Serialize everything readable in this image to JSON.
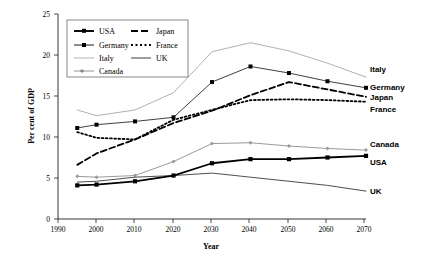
{
  "chart_data": {
    "type": "line",
    "title": "",
    "xlabel": "Year",
    "ylabel": "Per cent of GDP",
    "xlim": [
      1990,
      2070
    ],
    "ylim": [
      0,
      25
    ],
    "xticks": [
      1990,
      2000,
      2010,
      2020,
      2030,
      2040,
      2050,
      2060,
      2070
    ],
    "yticks": [
      0,
      5,
      10,
      15,
      20,
      25
    ],
    "grid": false,
    "legend_position": "top-left",
    "x": [
      1995,
      2000,
      2010,
      2020,
      2030,
      2040,
      2050,
      2060,
      2070
    ],
    "series": [
      {
        "name": "USA",
        "values": [
          4.1,
          4.2,
          4.6,
          5.3,
          6.8,
          7.3,
          7.3,
          7.5,
          7.7
        ]
      },
      {
        "name": "Japan",
        "values": [
          6.6,
          8.0,
          9.7,
          11.7,
          13.2,
          15.1,
          16.7,
          15.8,
          14.9
        ]
      },
      {
        "name": "Germany",
        "values": [
          11.1,
          11.5,
          11.9,
          12.4,
          16.7,
          18.6,
          17.8,
          16.8,
          16.0
        ]
      },
      {
        "name": "France",
        "values": [
          10.6,
          9.9,
          9.7,
          12.1,
          13.3,
          14.5,
          14.6,
          14.5,
          14.3
        ]
      },
      {
        "name": "Italy",
        "values": [
          13.3,
          12.6,
          13.3,
          15.4,
          20.4,
          21.5,
          20.5,
          19.0,
          17.3
        ]
      },
      {
        "name": "UK",
        "values": [
          4.5,
          4.6,
          5.1,
          5.3,
          5.6,
          5.1,
          4.6,
          4.1,
          3.4
        ]
      },
      {
        "name": "Canada",
        "values": [
          5.2,
          5.1,
          5.3,
          7.0,
          9.2,
          9.3,
          8.9,
          8.6,
          8.4
        ]
      }
    ]
  },
  "legend": {
    "items": [
      {
        "label": "USA"
      },
      {
        "label": "Japan"
      },
      {
        "label": "Germany"
      },
      {
        "label": "France"
      },
      {
        "label": "Italy"
      },
      {
        "label": "UK"
      },
      {
        "label": "Canada"
      }
    ]
  },
  "end_labels": [
    {
      "label": "Italy"
    },
    {
      "label": "Germany"
    },
    {
      "label": "Japan"
    },
    {
      "label": "France"
    },
    {
      "label": "Canada"
    },
    {
      "label": "USA"
    },
    {
      "label": "UK"
    }
  ],
  "axes": {
    "y_title": "Per cent of GDP",
    "x_title": "Year",
    "y_tick_labels": [
      "0",
      "5",
      "10",
      "15",
      "20",
      "25"
    ],
    "x_tick_labels": [
      "1990",
      "2000",
      "2010",
      "2020",
      "2030",
      "2040",
      "2050",
      "2060",
      "2070"
    ]
  }
}
